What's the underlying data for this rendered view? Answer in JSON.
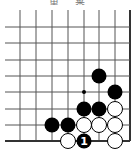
{
  "title": "黒 番",
  "board": {
    "cols_x": [
      20,
      36,
      52,
      68,
      84,
      99,
      115,
      130
    ],
    "rows_y": [
      27,
      43,
      60,
      76,
      92,
      109,
      125,
      141
    ],
    "edges": [
      "right",
      "bottom"
    ],
    "line_color": "#555555",
    "edge_color": "#333333"
  },
  "stones": [
    {
      "color": "black",
      "col": 5,
      "row": 3
    },
    {
      "color": "black",
      "col": 6,
      "row": 4
    },
    {
      "color": "black",
      "col": 4,
      "row": 5
    },
    {
      "color": "black",
      "col": 5,
      "row": 5
    },
    {
      "color": "white",
      "col": 6,
      "row": 5
    },
    {
      "color": "black",
      "col": 2,
      "row": 6
    },
    {
      "color": "black",
      "col": 3,
      "row": 6
    },
    {
      "color": "white",
      "col": 4,
      "row": 6
    },
    {
      "color": "white",
      "col": 5,
      "row": 6
    },
    {
      "color": "white",
      "col": 6,
      "row": 6
    },
    {
      "color": "white",
      "col": 3,
      "row": 7
    },
    {
      "color": "black",
      "col": 4,
      "row": 7,
      "label": "1"
    },
    {
      "color": "white",
      "col": 6,
      "row": 7
    }
  ],
  "markers": [
    {
      "type": "dot",
      "col": 4,
      "row": 4
    }
  ]
}
